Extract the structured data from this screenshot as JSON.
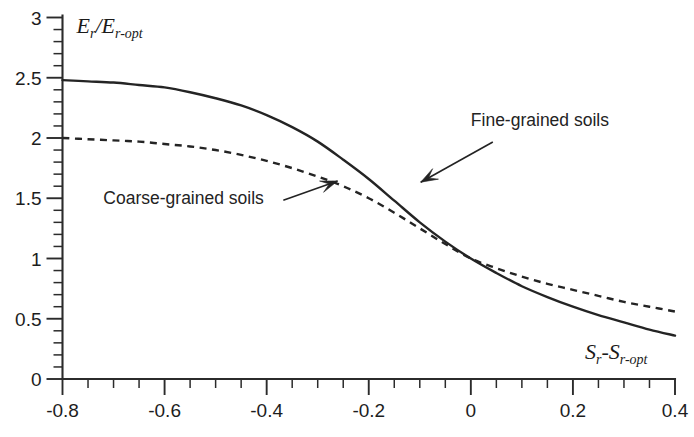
{
  "chart_data": {
    "type": "line",
    "title": "",
    "subtitle": "",
    "xlabel": "S_r - S_r-opt",
    "xlabel_parts": {
      "main1": "S",
      "sub1": "r",
      "dash": "-",
      "main2": "S",
      "sub2": "r-opt"
    },
    "ylabel": "E_r / E_r-opt",
    "ylabel_parts": {
      "main1": "E",
      "sub1": "r",
      "slash": "/",
      "main2": "E",
      "sub2": "r-opt"
    },
    "xlim": [
      -0.8,
      0.4
    ],
    "ylim": [
      0,
      3
    ],
    "xticks": [
      -0.8,
      -0.6,
      -0.4,
      -0.2,
      0,
      0.2,
      0.4
    ],
    "xticklabels": [
      "-0.8",
      "-0.6",
      "-0.4",
      "-0.2",
      "0",
      "0.2",
      "0.4"
    ],
    "yticks": [
      0,
      0.5,
      1,
      1.5,
      2,
      2.5,
      3
    ],
    "yticklabels": [
      "0",
      "0.5",
      "1",
      "1.5",
      "2",
      "2.5",
      "3"
    ],
    "x_minor_step": 0.05,
    "y_minor_step": 0.1,
    "grid": false,
    "legend_position": "inline-annotations",
    "x": [
      -0.8,
      -0.75,
      -0.7,
      -0.65,
      -0.6,
      -0.55,
      -0.5,
      -0.45,
      -0.4,
      -0.35,
      -0.3,
      -0.25,
      -0.2,
      -0.15,
      -0.1,
      -0.05,
      0.0,
      0.05,
      0.1,
      0.15,
      0.2,
      0.25,
      0.3,
      0.35,
      0.4
    ],
    "series": [
      {
        "name": "Fine-grained soils",
        "style": "solid",
        "values": [
          2.48,
          2.47,
          2.46,
          2.44,
          2.42,
          2.38,
          2.33,
          2.27,
          2.19,
          2.09,
          1.97,
          1.82,
          1.66,
          1.48,
          1.3,
          1.14,
          1.0,
          0.88,
          0.77,
          0.68,
          0.6,
          0.53,
          0.47,
          0.41,
          0.36
        ]
      },
      {
        "name": "Coarse-grained soils",
        "style": "dashed",
        "values": [
          2.0,
          1.99,
          1.98,
          1.97,
          1.95,
          1.93,
          1.9,
          1.86,
          1.81,
          1.75,
          1.68,
          1.6,
          1.5,
          1.38,
          1.25,
          1.12,
          1.0,
          0.92,
          0.85,
          0.79,
          0.74,
          0.69,
          0.64,
          0.6,
          0.56
        ]
      }
    ],
    "annotations": [
      {
        "text": "Fine-grained soils",
        "label_x": 0.0,
        "label_y": 2.1,
        "point_x": -0.11,
        "point_y": 1.6
      },
      {
        "text": "Coarse-grained soils",
        "label_x": -0.72,
        "label_y": 1.45,
        "point_x": -0.265,
        "point_y": 1.66
      }
    ],
    "colors": {
      "curve": "#242424",
      "axis": "#2b2b2b",
      "text": "#1a1a1a",
      "background": "#ffffff"
    }
  }
}
